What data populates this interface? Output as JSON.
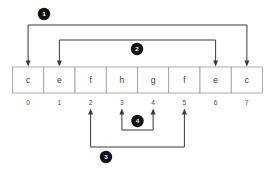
{
  "diagram": {
    "array": {
      "name": "character-array",
      "cells": [
        {
          "index": "0",
          "value": "c"
        },
        {
          "index": "1",
          "value": "e"
        },
        {
          "index": "2",
          "value": "f"
        },
        {
          "index": "3",
          "value": "h"
        },
        {
          "index": "4",
          "value": "g"
        },
        {
          "index": "5",
          "value": "f"
        },
        {
          "index": "6",
          "value": "e"
        },
        {
          "index": "7",
          "value": "c"
        }
      ]
    },
    "connectors": [
      {
        "label": "1",
        "from_index": "0",
        "to_index": "7",
        "side": "top"
      },
      {
        "label": "2",
        "from_index": "1",
        "to_index": "6",
        "side": "top"
      },
      {
        "label": "3",
        "from_index": "2",
        "to_index": "5",
        "side": "bottom"
      },
      {
        "label": "4",
        "from_index": "3",
        "to_index": "4",
        "side": "bottom"
      }
    ],
    "colors": {
      "badge_fill": "#111111",
      "badge_text": "#ffffff",
      "cell_border": "#9a9a9a",
      "cell_fill": "#ffffff",
      "connector_stroke": "#3a3a3a",
      "text": "#3c3c3c",
      "background": "#ffffff"
    }
  }
}
